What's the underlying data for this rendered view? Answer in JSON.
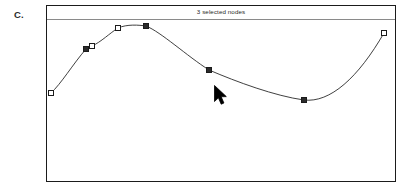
{
  "figure": {
    "label": "C."
  },
  "panel": {
    "header": {
      "status_text": "3 selected nodes",
      "selected_count": 3
    },
    "frame": {
      "border_color": "#1b1b1b",
      "separator_color": "#8a8a8a",
      "background": "#ffffff"
    }
  },
  "cursor": {
    "icon": "arrow-pointer-icon",
    "color": "#000000",
    "x": 216,
    "y": 87
  },
  "chart_data": {
    "type": "line",
    "title": "",
    "subtitle": "",
    "xlabel": "",
    "ylabel": "",
    "xlim": [
      0,
      350
    ],
    "ylim": [
      0,
      163
    ],
    "grid": false,
    "legend": null,
    "curve_style": {
      "stroke": "#2a2a2a",
      "stroke_width": 0.9,
      "interpolation": "smooth-spline",
      "fill": "none"
    },
    "node_style": {
      "size": 5,
      "unselected_fill": "#ffffff",
      "selected_fill": "#2b2b2b",
      "stroke": "#1b1b1b"
    },
    "nodes": [
      {
        "index": 0,
        "x": 4,
        "y": 73,
        "selected": false,
        "label": "node-1"
      },
      {
        "index": 1,
        "x": 39,
        "y": 29,
        "selected": true,
        "label": "node-2"
      },
      {
        "index": 2,
        "x": 45,
        "y": 26,
        "selected": false,
        "label": "node-3"
      },
      {
        "index": 3,
        "x": 71,
        "y": 8,
        "selected": false,
        "label": "node-4"
      },
      {
        "index": 4,
        "x": 99,
        "y": 6,
        "selected": true,
        "label": "node-5"
      },
      {
        "index": 5,
        "x": 162,
        "y": 50,
        "selected": true,
        "label": "node-6"
      },
      {
        "index": 6,
        "x": 257,
        "y": 80,
        "selected": true,
        "label": "node-7"
      },
      {
        "index": 7,
        "x": 337,
        "y": 13,
        "selected": false,
        "label": "node-8"
      }
    ],
    "path": "M 4 73 C 14 64, 26 44, 39 29 C 41 27, 43 26, 45 26 C 54 22, 63 13, 71 8 C 80 4, 92 5, 99 6 C 114 12, 140 36, 162 50 C 190 62, 228 76, 257 80 C 283 83, 311 58, 337 13"
  }
}
